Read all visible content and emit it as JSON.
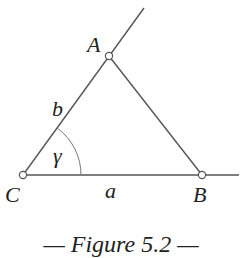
{
  "figure": {
    "caption": "— Figure 5.2 —",
    "vertices": {
      "A": {
        "label": "A"
      },
      "B": {
        "label": "B"
      },
      "C": {
        "label": "C"
      }
    },
    "sides": {
      "a": {
        "label": "a",
        "between": [
          "C",
          "B"
        ]
      },
      "b": {
        "label": "b",
        "between": [
          "C",
          "A"
        ]
      }
    },
    "angle": {
      "label": "γ",
      "at": "C"
    }
  }
}
